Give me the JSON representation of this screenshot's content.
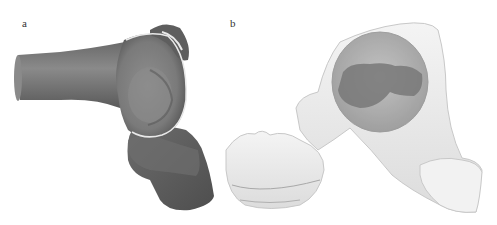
{
  "figure": {
    "panels": [
      {
        "label": "a",
        "content": "3D rendered bone model, opaque gray surface with outlined articular rim"
      },
      {
        "label": "b",
        "content": "3D rendered bone model, translucent white surface with darker inner region"
      }
    ],
    "colors": {
      "background": "#ffffff",
      "panel_a_surface": "#7a7a7a",
      "panel_a_shadow": "#4a4a4a",
      "panel_a_rim": "#e8e8e8",
      "panel_b_surface": "#ececec",
      "panel_b_outline": "#c8c8c8",
      "panel_b_inner": "#a0a0a0",
      "panel_b_core": "#7c7c7c"
    }
  }
}
